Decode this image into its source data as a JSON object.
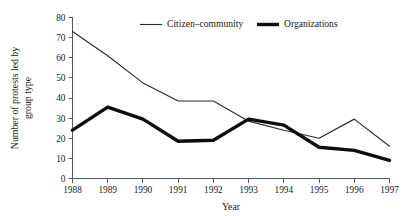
{
  "chart_data": {
    "type": "line",
    "title": "",
    "xlabel": "Year",
    "ylabel": "Number  of protests led by group type",
    "ylabel_line1": "Number  of protests led by",
    "ylabel_line2": "group type",
    "x": [
      1988,
      1989,
      1990,
      1991,
      1992,
      1993,
      1994,
      1995,
      1996,
      1997
    ],
    "xtick_labels": [
      "1988",
      "1989",
      "1990",
      "1991",
      "1992",
      "1993",
      "1994",
      "1995",
      "1996",
      "1997"
    ],
    "ytick_labels": [
      "0",
      "10",
      "20",
      "30",
      "40",
      "50",
      "60",
      "70",
      "80"
    ],
    "yticks": [
      0,
      10,
      20,
      30,
      40,
      50,
      60,
      70,
      80
    ],
    "ylim": [
      0,
      80
    ],
    "xlim": [
      1988,
      1997
    ],
    "grid": false,
    "legend_position": "top-center",
    "series": [
      {
        "name": "Citizen–community",
        "style": "thin",
        "color": "#2b2b2b",
        "values": [
          73,
          61,
          47.5,
          38.5,
          38.5,
          28.5,
          24,
          20,
          29.5,
          16
        ]
      },
      {
        "name": "Organizations",
        "style": "thick",
        "color": "#0d0d0d",
        "values": [
          24,
          35.5,
          29.5,
          18.5,
          19,
          29.5,
          26.5,
          15.5,
          14,
          9
        ]
      }
    ]
  },
  "legend": {
    "items": [
      {
        "label": "Citizen–community"
      },
      {
        "label": "Organizations"
      }
    ]
  }
}
